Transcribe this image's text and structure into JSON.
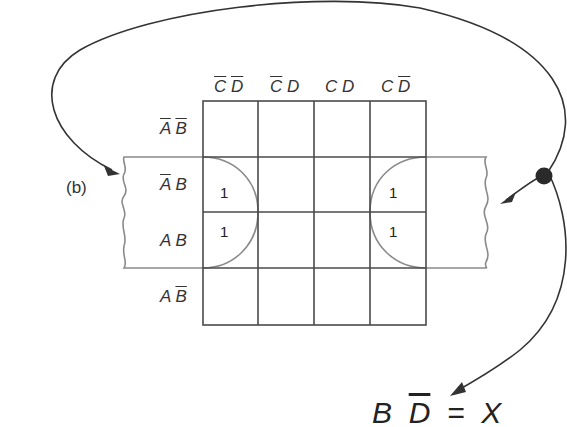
{
  "figure_label": "(b)",
  "kmap": {
    "col_headers": [
      {
        "a": "C",
        "a_bar": true,
        "b": "D",
        "b_bar": true
      },
      {
        "a": "C",
        "a_bar": true,
        "b": "D",
        "b_bar": false
      },
      {
        "a": "C",
        "a_bar": false,
        "b": "D",
        "b_bar": false
      },
      {
        "a": "C",
        "a_bar": false,
        "b": "D",
        "b_bar": true
      }
    ],
    "row_headers": [
      {
        "a": "A",
        "a_bar": true,
        "b": "B",
        "b_bar": true
      },
      {
        "a": "A",
        "a_bar": true,
        "b": "B",
        "b_bar": false
      },
      {
        "a": "A",
        "a_bar": false,
        "b": "B",
        "b_bar": false
      },
      {
        "a": "A",
        "a_bar": false,
        "b": "B",
        "b_bar": true
      }
    ],
    "cells": [
      [
        "",
        "",
        "",
        ""
      ],
      [
        "1",
        "",
        "",
        "1"
      ],
      [
        "1",
        "",
        "",
        "1"
      ],
      [
        "",
        "",
        "",
        ""
      ]
    ]
  },
  "result": {
    "term1": "B",
    "term2": "D",
    "term2_bar": true,
    "equals": "=",
    "output": "X"
  },
  "colors": {
    "grid": "#4a4a4a",
    "loop": "#8a8a8a",
    "arrow": "#333333",
    "dot": "#2a2a2a"
  }
}
